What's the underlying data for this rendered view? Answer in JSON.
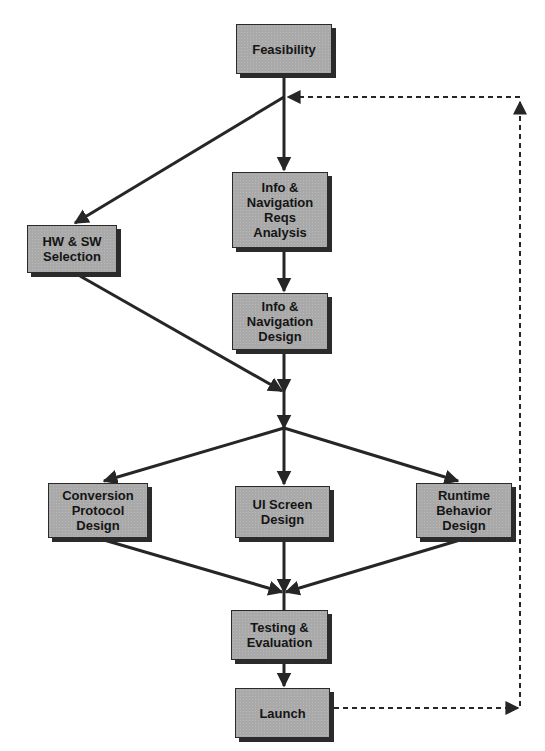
{
  "diagram": {
    "type": "flowchart",
    "colors": {
      "node_fill": "#a9a9a9",
      "node_border": "#2a2a2a",
      "shadow": "#2b2b2b",
      "edge": "#262626",
      "text": "#151515",
      "background": "#ffffff"
    },
    "nodes": [
      {
        "id": "feasibility",
        "label": "Feasibility"
      },
      {
        "id": "info-nav-reqs",
        "label": "Info &\nNavigation\nReqs\nAnalysis"
      },
      {
        "id": "hw-sw",
        "label": "HW & SW\nSelection"
      },
      {
        "id": "info-nav-design",
        "label": "Info &\nNavigation\nDesign"
      },
      {
        "id": "conversion",
        "label": "Conversion\nProtocol\nDesign"
      },
      {
        "id": "ui-screen",
        "label": "UI Screen\nDesign"
      },
      {
        "id": "runtime",
        "label": "Runtime\nBehavior\nDesign"
      },
      {
        "id": "testing",
        "label": "Testing &\nEvaluation"
      },
      {
        "id": "launch",
        "label": "Launch"
      }
    ],
    "edges": [
      {
        "from": "feasibility",
        "to": "info-nav-reqs",
        "style": "solid"
      },
      {
        "from": "feasibility",
        "to": "hw-sw",
        "style": "solid"
      },
      {
        "from": "info-nav-reqs",
        "to": "info-nav-design",
        "style": "solid"
      },
      {
        "from": "info-nav-design",
        "to": "merge-1",
        "style": "solid"
      },
      {
        "from": "hw-sw",
        "to": "merge-1",
        "style": "solid"
      },
      {
        "from": "merge-1",
        "to": "conversion",
        "style": "solid"
      },
      {
        "from": "merge-1",
        "to": "ui-screen",
        "style": "solid"
      },
      {
        "from": "merge-1",
        "to": "runtime",
        "style": "solid"
      },
      {
        "from": "conversion",
        "to": "testing",
        "style": "solid"
      },
      {
        "from": "ui-screen",
        "to": "testing",
        "style": "solid"
      },
      {
        "from": "runtime",
        "to": "testing",
        "style": "solid"
      },
      {
        "from": "testing",
        "to": "launch",
        "style": "solid"
      },
      {
        "from": "launch",
        "to": "feasibility-junction",
        "style": "dashed",
        "note": "feedback loop"
      }
    ]
  }
}
